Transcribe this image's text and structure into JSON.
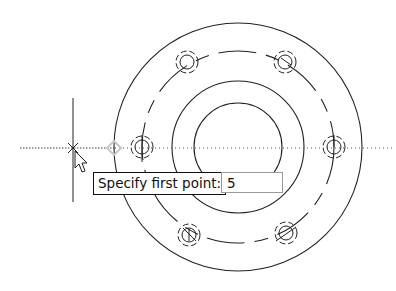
{
  "viewport": {
    "title": "CAD drawing viewport",
    "background": "#ffffff",
    "line_color": "#222222"
  },
  "drawing": {
    "center": [
      238,
      147
    ],
    "outer_circle_radius": 126,
    "middle_circle_radius": 66,
    "inner_circle_radius": 44,
    "bolt_circle_radius": 96,
    "bolt_holes": [
      {
        "x": 142,
        "y": 147,
        "marker": "vertical-line"
      },
      {
        "x": 187,
        "y": 64,
        "marker": "none"
      },
      {
        "x": 285,
        "y": 64,
        "marker": "diagonal-line"
      },
      {
        "x": 334,
        "y": 147,
        "marker": "vertical-line"
      },
      {
        "x": 285,
        "y": 231,
        "marker": "diagonal-line"
      },
      {
        "x": 189,
        "y": 233,
        "marker": "cross"
      }
    ]
  },
  "cursor": {
    "crosshair": [
      73,
      148
    ],
    "tracking_line_y": 148,
    "snap_marker": [
      114,
      148
    ],
    "icon": "arrow-cursor-icon"
  },
  "dynamic_input": {
    "prompt": "Specify first point:",
    "value": "5"
  }
}
